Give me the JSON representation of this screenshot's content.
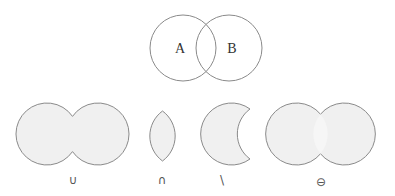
{
  "diagram": {
    "sets": [
      {
        "id": "A",
        "label": "A"
      },
      {
        "id": "B",
        "label": "B"
      }
    ],
    "operations": [
      {
        "id": "union",
        "symbol": "∪",
        "name": "union"
      },
      {
        "id": "intersection",
        "symbol": "∩",
        "name": "intersection"
      },
      {
        "id": "difference",
        "symbol": "\\",
        "name": "difference"
      },
      {
        "id": "symmetric-difference",
        "symbol": "⊖",
        "name": "symmetric difference"
      }
    ],
    "colors": {
      "stroke": "#8a8a8a",
      "fill": "#f0f0f0",
      "text": "#333333"
    }
  }
}
